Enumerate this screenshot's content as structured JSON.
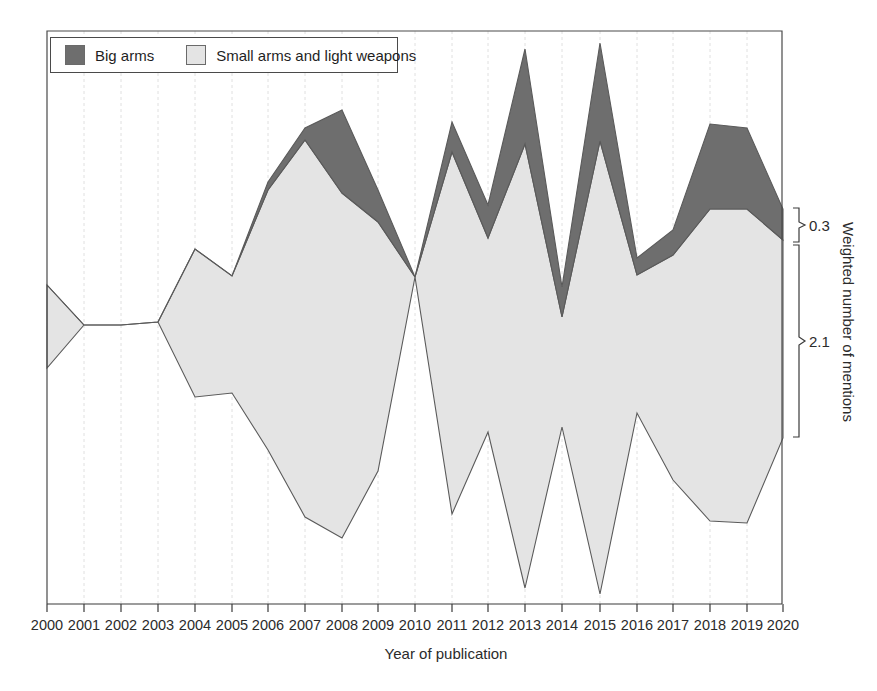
{
  "chart_data": {
    "type": "area",
    "subtype": "streamgraph",
    "title": "",
    "xlabel": "Year of publication",
    "ylabel": "Weighted number of mentions",
    "grid": true,
    "legend_position": "top-left",
    "x": [
      2000,
      2001,
      2002,
      2003,
      2004,
      2005,
      2006,
      2007,
      2008,
      2009,
      2010,
      2011,
      2012,
      2013,
      2014,
      2015,
      2016,
      2017,
      2018,
      2019,
      2020
    ],
    "categories": [
      "2000",
      "2001",
      "2002",
      "2003",
      "2004",
      "2005",
      "2006",
      "2007",
      "2008",
      "2009",
      "2010",
      "2011",
      "2012",
      "2013",
      "2014",
      "2015",
      "2016",
      "2017",
      "2018",
      "2019",
      "2020"
    ],
    "xlim": [
      2000,
      2020
    ],
    "series": [
      {
        "name": "Big arms",
        "color": "#6e6e6e",
        "values": [
          0.0,
          0.0,
          0.0,
          0.0,
          0.0,
          0.0,
          0.09,
          0.13,
          0.9,
          0.33,
          0.0,
          0.31,
          0.36,
          1.04,
          0.33,
          1.06,
          0.18,
          0.5,
          0.92,
          0.74,
          0.3
        ]
      },
      {
        "name": "Small arms and light weapons",
        "color": "#e4e4e4",
        "values": [
          0.9,
          0.0,
          0.0,
          0.0,
          1.61,
          1.27,
          1.74,
          2.44,
          2.47,
          2.16,
          0.0,
          2.12,
          2.47,
          2.56,
          1.52,
          2.82,
          2.38,
          2.42,
          2.44,
          2.42,
          2.1
        ]
      }
    ],
    "annotations": [
      {
        "label": "0.3",
        "series": "Big arms",
        "at_year": 2020
      },
      {
        "label": "2.1",
        "series": "Small arms and light weapons",
        "at_year": 2020
      }
    ],
    "geometry": {
      "note": "pixel polygons as drawn, x index 0..20 mapped across plot",
      "plot": {
        "left": 47,
        "right": 782,
        "top": 31,
        "bottom": 604
      },
      "big_arms_top": [
        [
          47,
          285
        ],
        [
          84,
          325
        ],
        [
          121,
          325
        ],
        [
          158,
          322
        ],
        [
          195,
          249
        ],
        [
          232,
          276
        ],
        [
          268,
          182
        ],
        [
          305,
          128
        ],
        [
          342,
          110
        ],
        [
          378,
          190
        ],
        [
          415,
          277
        ],
        [
          452,
          122
        ],
        [
          488,
          205
        ],
        [
          525,
          49
        ],
        [
          562,
          287
        ],
        [
          600,
          43
        ],
        [
          637,
          258
        ],
        [
          673,
          230
        ],
        [
          710,
          124
        ],
        [
          747,
          128
        ],
        [
          783,
          209
        ]
      ],
      "boundary": [
        [
          47,
          285
        ],
        [
          84,
          325
        ],
        [
          121,
          325
        ],
        [
          158,
          322
        ],
        [
          195,
          249
        ],
        [
          232,
          276
        ],
        [
          268,
          190
        ],
        [
          305,
          140
        ],
        [
          342,
          193
        ],
        [
          378,
          222
        ],
        [
          415,
          277
        ],
        [
          452,
          152
        ],
        [
          488,
          238
        ],
        [
          525,
          144
        ],
        [
          562,
          317
        ],
        [
          600,
          141
        ],
        [
          637,
          275
        ],
        [
          673,
          255
        ],
        [
          710,
          209
        ],
        [
          747,
          209
        ],
        [
          783,
          240
        ]
      ],
      "small_arms_bottom": [
        [
          47,
          368
        ],
        [
          84,
          325
        ],
        [
          121,
          325
        ],
        [
          158,
          322
        ],
        [
          195,
          397
        ],
        [
          232,
          393
        ],
        [
          268,
          450
        ],
        [
          305,
          517
        ],
        [
          342,
          538
        ],
        [
          378,
          471
        ],
        [
          415,
          277
        ],
        [
          452,
          514
        ],
        [
          488,
          432
        ],
        [
          525,
          588
        ],
        [
          562,
          427
        ],
        [
          600,
          594
        ],
        [
          637,
          413
        ],
        [
          673,
          480
        ],
        [
          710,
          521
        ],
        [
          747,
          523
        ],
        [
          783,
          438
        ]
      ]
    }
  },
  "legend": {
    "items": [
      {
        "label": "Big arms",
        "color": "#6e6e6e"
      },
      {
        "label": "Small arms and light weapons",
        "color": "#e4e4e4"
      }
    ]
  },
  "axes": {
    "x_title": "Year of publication",
    "y_title": "Weighted number of mentions",
    "x_tick_labels": [
      "2000",
      "2001",
      "2002",
      "2003",
      "2004",
      "2005",
      "2006",
      "2007",
      "2008",
      "2009",
      "2010",
      "2011",
      "2012",
      "2013",
      "2014",
      "2015",
      "2016",
      "2017",
      "2018",
      "2019",
      "2020"
    ]
  },
  "brace_labels": {
    "upper": "0.3",
    "lower": "2.1"
  }
}
